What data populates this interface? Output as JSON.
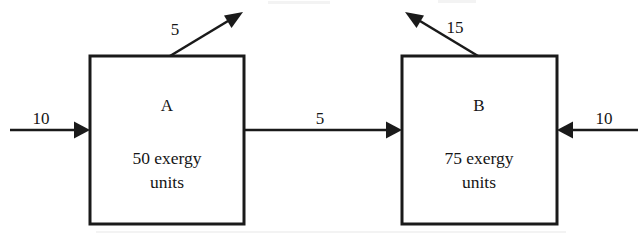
{
  "diagram": {
    "type": "exergy-flow-block-diagram",
    "background_color": "#ffffff",
    "ink_color": "#1a1a1a",
    "boxes": [
      {
        "id": "A",
        "name": "A",
        "value_line": "50 exergy",
        "units_line": "units",
        "exergy_units": 50
      },
      {
        "id": "B",
        "name": "B",
        "value_line": "75 exergy",
        "units_line": "units",
        "exergy_units": 75
      }
    ],
    "flows": [
      {
        "id": "input-a",
        "label": "10",
        "value": 10,
        "direction": "right",
        "kind": "input",
        "target": "A"
      },
      {
        "id": "loss-a",
        "label": "5",
        "value": 5,
        "direction": "up-right",
        "kind": "loss",
        "source": "A"
      },
      {
        "id": "a-to-b",
        "label": "5",
        "value": 5,
        "direction": "right",
        "kind": "transfer",
        "source": "A",
        "target": "B"
      },
      {
        "id": "loss-b",
        "label": "15",
        "value": 15,
        "direction": "up-left",
        "kind": "loss",
        "source": "B"
      },
      {
        "id": "input-b",
        "label": "10",
        "value": 10,
        "direction": "left",
        "kind": "input",
        "target": "B"
      }
    ]
  }
}
